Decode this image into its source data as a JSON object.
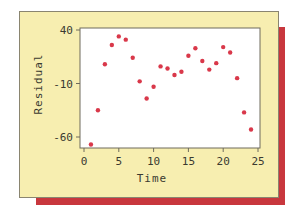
{
  "chart_data": {
    "type": "scatter",
    "title": "",
    "xlabel": "Time",
    "ylabel": "Residual",
    "xlim": [
      0,
      25
    ],
    "ylim": [
      -62,
      42
    ],
    "xticks": [
      0,
      5,
      10,
      15,
      20,
      25
    ],
    "yticks": [
      40,
      -10,
      -60
    ],
    "xtick_labels": [
      "0",
      "5",
      "10",
      "15",
      "20",
      "25"
    ],
    "ytick_labels": [
      "40",
      "-10",
      "-60"
    ],
    "grid": false,
    "legend": null,
    "series": [
      {
        "name": "Residual",
        "color": "#d9384a",
        "x": [
          1,
          2,
          3,
          4,
          5,
          6,
          7,
          8,
          9,
          10,
          11,
          12,
          13,
          14,
          15,
          16,
          17,
          18,
          19,
          20,
          21,
          22,
          23,
          24
        ],
        "y": [
          -67,
          -35,
          8,
          26,
          34,
          31,
          14,
          -8,
          -24,
          -13,
          6,
          4,
          -2,
          1,
          16,
          23,
          11,
          3,
          9,
          24,
          19,
          -5,
          -37,
          -53
        ]
      }
    ]
  },
  "colors": {
    "panel_bg": "#f7eeb0",
    "shadow": "#c8373d",
    "plot_bg": "#ffffff",
    "point": "#d9384a",
    "text": "#3a3a30"
  }
}
